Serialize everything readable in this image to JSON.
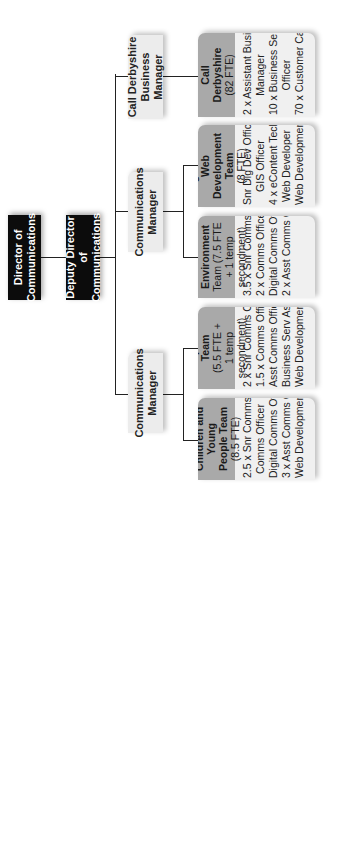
{
  "director": {
    "line1": "Director of",
    "line2": "Communications"
  },
  "deputy": {
    "line1": "Deputy Director of",
    "line2": "Communications"
  },
  "managers": [
    {
      "line1": "Communications",
      "line2": "Manager"
    },
    {
      "line1": "Communications",
      "line2": "Manager"
    },
    {
      "line1": "Call Derbyshire",
      "line2": "Business Manager"
    }
  ],
  "teams": [
    {
      "name": "Children and Young People Team",
      "head_lines": [
        "Children and Young",
        "People Team"
      ],
      "fte": "(8.5 FTE)",
      "roles": [
        "2.5 x Snr Comms Officer",
        "Comms Officer",
        "Digital Comms Officer",
        "3 x Asst Comms Officer",
        "Web Development Asst"
      ]
    },
    {
      "name": "Corporate Team",
      "head_lines": [
        "Corporate Team"
      ],
      "fte": "(5.5 FTE +",
      "fte2": "1 temp secondment)",
      "roles": [
        "2 x Snr Comms Officer",
        "1.5 x Comms Officer",
        "Asst Comms Officer",
        "Business Serv Asst",
        "Web Development Asst"
      ]
    },
    {
      "name": "Adults and Environment Team",
      "head_lines": [
        "Adults and Environment"
      ],
      "fte": "Team (7.5 FTE + 1 temp",
      "fte2": "secondment)",
      "roles": [
        "3.5 x Snr Comms Officer",
        "2 x Comms Officer",
        "Digital Comms Officer",
        "2 x Asst Comms Officer"
      ]
    },
    {
      "name": "Digital and Web Development Team",
      "head_lines": [
        "Digital and Web",
        "Development Team"
      ],
      "fte": "(8 FTE)",
      "roles": [
        "Snr Dig Dev Officer",
        "GIS Officer",
        "4 x eContent Tech Officer",
        "Web Developer",
        "Web Development Asst"
      ]
    },
    {
      "name": "Call Derbyshire",
      "head_lines": [
        "Call",
        "Derbyshire"
      ],
      "fte": "(82 FTE)",
      "roles": [
        "2 x Assistant Business",
        "Manager",
        "10 x Business Service",
        "Officer",
        "70 x Customer Care Asst"
      ]
    }
  ]
}
